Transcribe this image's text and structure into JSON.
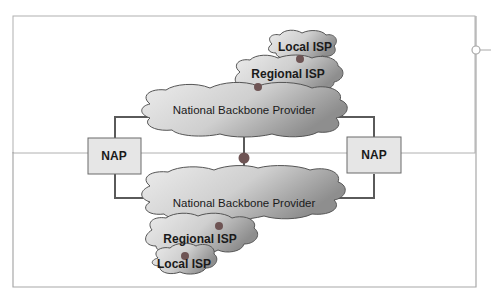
{
  "diagram": {
    "nodes": {
      "top_local_isp": "Local ISP",
      "top_regional_isp": "Regional ISP",
      "top_backbone": "National Backbone Provider",
      "left_nap": "NAP",
      "right_nap": "NAP",
      "bottom_backbone": "National Backbone Provider",
      "bottom_regional_isp": "Regional ISP",
      "bottom_local_isp": "Local ISP"
    },
    "colors": {
      "cloud_fill_light": "#e4e4e4",
      "cloud_fill_dark": "#8f8f8f",
      "nap_fill": "#e6e6e6",
      "connector": "#5a5a5a",
      "dot": "#7a5a5a",
      "frame": "#a8a8a8"
    }
  }
}
